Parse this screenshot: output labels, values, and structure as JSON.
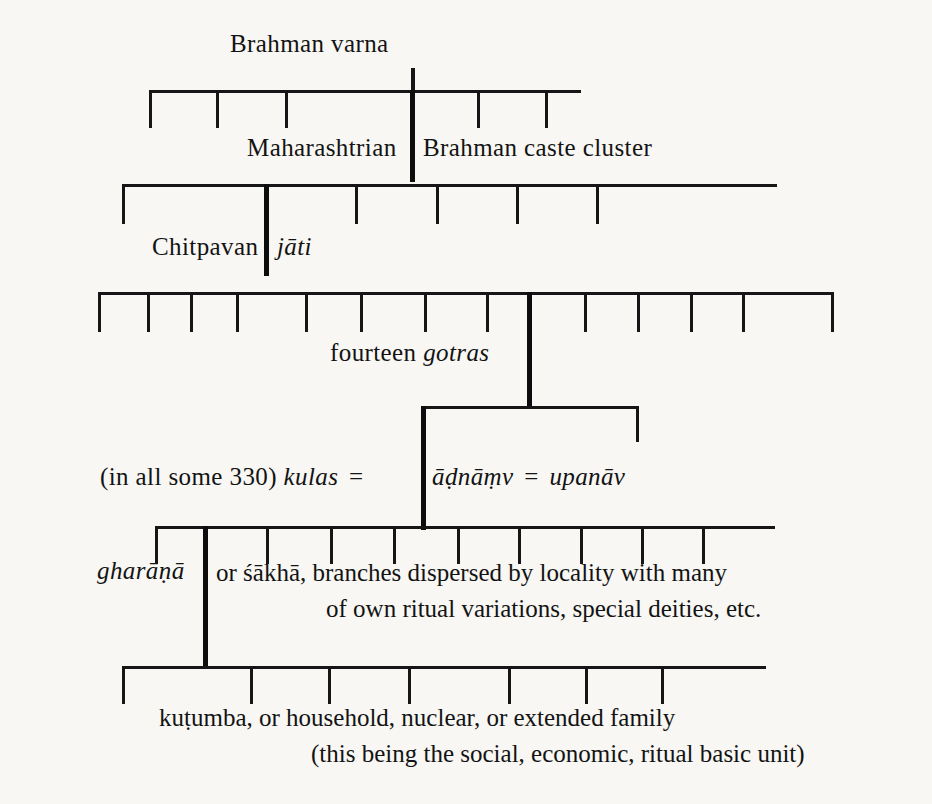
{
  "diagram": {
    "title_implicit": "Chitpavan Brahman social structure hierarchy",
    "levels": [
      {
        "id": "varna",
        "label": "Brahman varna",
        "label_plain": "Brahman varna",
        "branch_count": 6
      },
      {
        "id": "caste-cluster",
        "label_left": "Maharashtrian",
        "label_right": "Brahman caste cluster",
        "branch_count": 6
      },
      {
        "id": "jati",
        "label_left": "Chitpavan",
        "label_right_italic": "jāti",
        "branch_count": 14
      },
      {
        "id": "gotras",
        "label_plain": "fourteen",
        "label_italic": "gotras",
        "branch_count": 2
      },
      {
        "id": "kulas",
        "label_left_plain": "(in all some 330)",
        "label_left_italic": "kulas",
        "equals_1": "=",
        "label_right_italic_1": "āḍnāṃv",
        "equals_2": "=",
        "label_right_italic_2": "upanāv",
        "branch_count": 10
      },
      {
        "id": "gharana",
        "label_italic": "gharāṇā",
        "line_1_a": "or",
        "line_1_b": "śākhā",
        "line_1_c": ", branches dispersed by locality with many",
        "line_2": "of own ritual variations, special deities, etc.",
        "branch_count": 7
      },
      {
        "id": "kutumba",
        "line_1_italic": "kuṭumba",
        "line_1_rest": ", or household, nuclear, or extended family",
        "line_2": "(this being the social, economic, ritual basic unit)"
      }
    ],
    "text": {
      "brahman_varna": "Brahman varna",
      "maharashtrian": "Maharashtrian",
      "brahman_caste_cluster": "Brahman caste cluster",
      "chitpavan": "Chitpavan",
      "jati": "jāti",
      "fourteen": "fourteen",
      "gotras": "gotras",
      "in_all_some_330": "(in all some 330)",
      "kulas": "kulas",
      "equals": "=",
      "adnamv": "āḍnāṃv",
      "upanav": "upanāv",
      "gharana": "gharāṇā",
      "or": "or",
      "sakha": "śākhā",
      "sakha_rest": ", branches dispersed by locality with many",
      "gharana_line2": "of own ritual variations, special deities, etc.",
      "kutumba": "kuṭumba",
      "kutumba_rest": ", or household, nuclear, or extended family",
      "kutumba_line2": "(this being the social, economic, ritual basic unit)"
    },
    "colors": {
      "ink": "#161616",
      "paper": "#f8f7f4"
    }
  }
}
